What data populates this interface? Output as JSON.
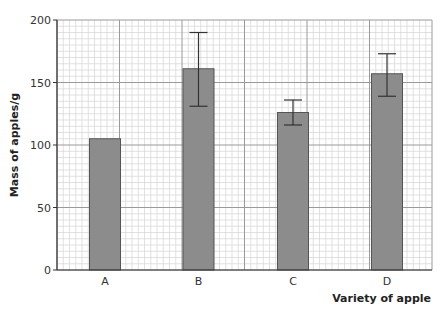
{
  "chart_data": {
    "type": "bar",
    "title": "",
    "xlabel": "Variety of apple",
    "ylabel": "Mass of apples/g",
    "categories": [
      "A",
      "B",
      "C",
      "D"
    ],
    "values": [
      105,
      161,
      126,
      157
    ],
    "error_bars": [
      null,
      {
        "low": 131,
        "high": 190
      },
      {
        "low": 116,
        "high": 136
      },
      {
        "low": 139,
        "high": 173
      }
    ],
    "ylim": [
      0,
      200
    ],
    "yticks": [
      0,
      50,
      100,
      150,
      200
    ],
    "grid": true,
    "legend": null,
    "bar_color": "#8c8c8c"
  }
}
